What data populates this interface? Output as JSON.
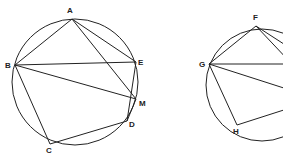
{
  "figure_left": {
    "circle": {
      "cx": 75,
      "cy": 82,
      "r": 63
    },
    "points": [
      {
        "id": "A",
        "x": 72,
        "y": 19,
        "lx": 67,
        "ly": 13
      },
      {
        "id": "B",
        "x": 15,
        "y": 65,
        "lx": 5,
        "ly": 68
      },
      {
        "id": "E",
        "x": 136,
        "y": 62,
        "lx": 138,
        "ly": 65
      },
      {
        "id": "M",
        "x": 136,
        "y": 99,
        "lx": 139,
        "ly": 106
      },
      {
        "id": "D",
        "x": 127,
        "y": 121,
        "lx": 129,
        "ly": 127
      },
      {
        "id": "C",
        "x": 50,
        "y": 144,
        "lx": 46,
        "ly": 153
      }
    ],
    "segments": [
      [
        "A",
        "B"
      ],
      [
        "A",
        "E"
      ],
      [
        "A",
        "M"
      ],
      [
        "B",
        "E"
      ],
      [
        "B",
        "M"
      ],
      [
        "B",
        "C"
      ],
      [
        "C",
        "D"
      ],
      [
        "D",
        "M"
      ],
      [
        "D",
        "E"
      ]
    ]
  },
  "figure_right": {
    "circle": {
      "cx": 262,
      "cy": 85,
      "r": 56
    },
    "points": [
      {
        "id": "F",
        "x": 256,
        "y": 26,
        "lx": 253,
        "ly": 20
      },
      {
        "id": "G",
        "x": 209,
        "y": 64,
        "lx": 199,
        "ly": 67
      },
      {
        "id": "H",
        "x": 237,
        "y": 125,
        "lx": 233,
        "ly": 134
      }
    ],
    "segments_partial": [
      [
        256,
        26,
        209,
        64
      ],
      [
        256,
        26,
        290,
        62
      ],
      [
        256,
        26,
        290,
        48
      ],
      [
        209,
        64,
        290,
        64
      ],
      [
        209,
        64,
        290,
        90
      ],
      [
        209,
        64,
        237,
        125
      ],
      [
        237,
        125,
        290,
        108
      ]
    ]
  }
}
